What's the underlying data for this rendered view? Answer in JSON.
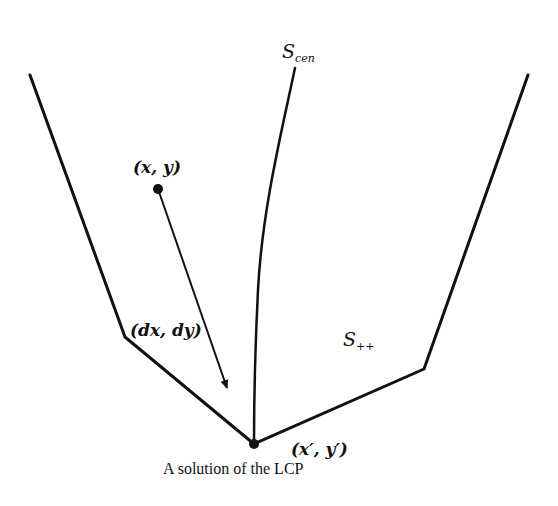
{
  "diagram": {
    "stroke_color": "#111111",
    "background": "#ffffff",
    "labels": {
      "central_path": {
        "base": "S",
        "sub": "cen"
      },
      "feasible_region": {
        "base": "S",
        "sub": "++"
      },
      "start_point": "(x, y)",
      "direction": "(dx, dy)",
      "solution_point": "(x′, y′)",
      "caption": "A solution of the LCP"
    },
    "geometry": {
      "left_boundary": [
        [
          30,
          75
        ],
        [
          125,
          337
        ],
        [
          254,
          444
        ]
      ],
      "right_boundary": [
        [
          254,
          444
        ],
        [
          424,
          369
        ],
        [
          528,
          75
        ]
      ],
      "central_path_start": [
        295,
        68
      ],
      "central_path_end": [
        254,
        444
      ],
      "start_point": [
        158,
        189
      ],
      "arrow_tip": [
        227,
        390
      ],
      "solution_point": [
        254,
        444
      ]
    }
  }
}
